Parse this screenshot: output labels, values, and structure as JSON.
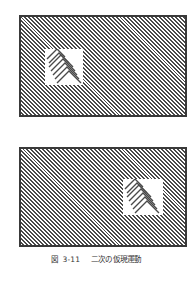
{
  "figure": {
    "label": "図",
    "number": "3-11",
    "title": "二次の仮現運動"
  },
  "panels": [
    {
      "name": "frame-1",
      "patch_position": "left"
    },
    {
      "name": "frame-2",
      "patch_position": "right"
    }
  ],
  "colors": {
    "stripe": "#4a4a4a",
    "border": "#3a3a3a",
    "caption": "#333333"
  }
}
